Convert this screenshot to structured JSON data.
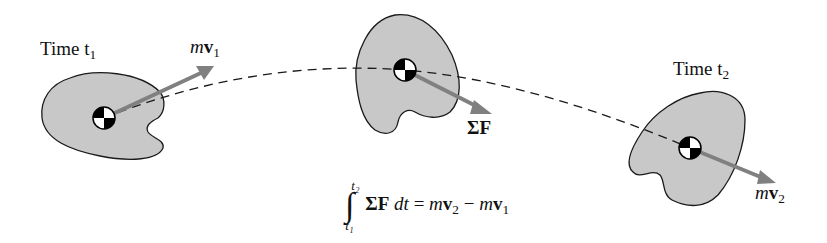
{
  "figure": {
    "body_color": "#c8c8c8",
    "outline_color": "#1a1a1a",
    "arrow_color": "#808080",
    "path_style": "dashed"
  },
  "labels": {
    "time1": "Time t",
    "time1_sub": "1",
    "time2": "Time t",
    "time2_sub": "2",
    "mv1_m": "m",
    "mv1_v": "v",
    "mv1_sub": "1",
    "mv2_m": "m",
    "mv2_v": "v",
    "mv2_sub": "2",
    "force": "ΣF"
  },
  "equation": {
    "integral": "∫",
    "upper": "t₂",
    "lower": "t₁",
    "integrand": "ΣF",
    "dt": " dt",
    "equals": " = ",
    "rhs_m1": "m",
    "rhs_v1": "v",
    "rhs_sub1": "2",
    "minus": " − ",
    "rhs_m2": "m",
    "rhs_v2": "v",
    "rhs_sub2": "1"
  }
}
